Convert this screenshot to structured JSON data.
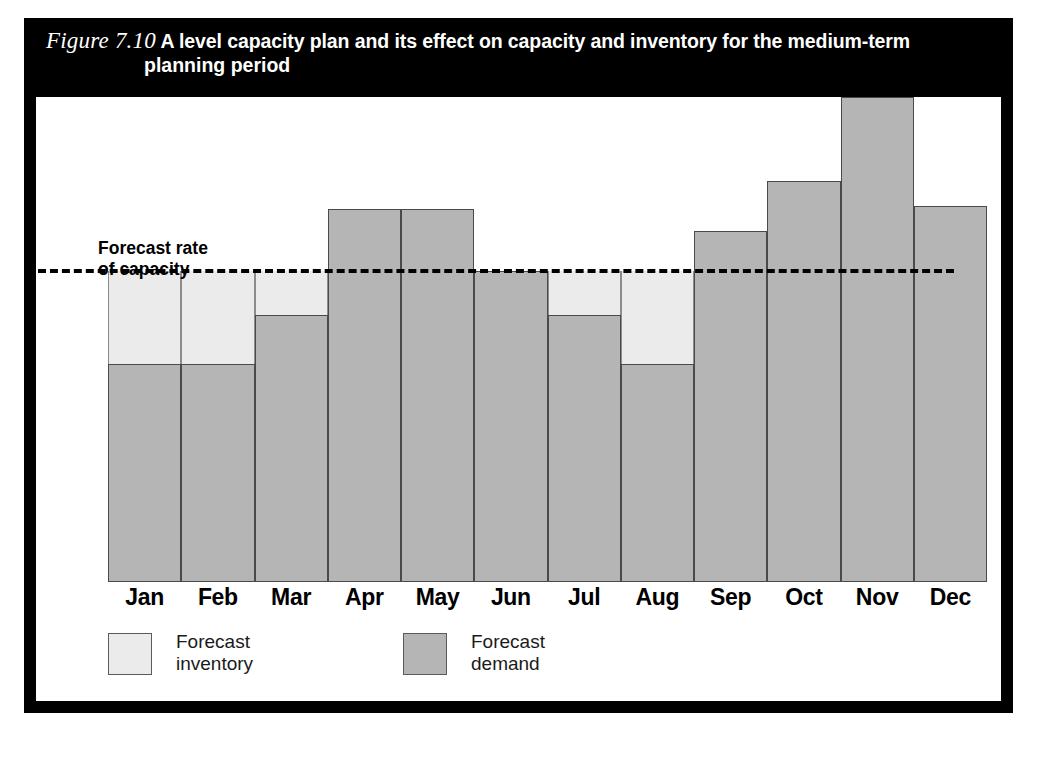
{
  "figure": {
    "number": "Figure 7.10",
    "title_line1": "A level capacity plan and its effect on capacity and inventory for the medium-term",
    "title_line2": "planning period"
  },
  "annotation": {
    "capacity_label_line1": "Forecast rate",
    "capacity_label_line2": "of capacity"
  },
  "legend": {
    "items": [
      {
        "label_line1": "Forecast",
        "label_line2": "inventory",
        "swatch": "light",
        "color": "#ebebeb"
      },
      {
        "label_line1": "Forecast",
        "label_line2": "demand",
        "swatch": "dark",
        "color": "#b5b5b5"
      }
    ]
  },
  "colors": {
    "frame": "#000000",
    "panel": "#ffffff",
    "inventory_fill": "#ebebeb",
    "demand_fill": "#b5b5b5",
    "demand_stroke": "#4a4a4a",
    "capacity_line": "#000000"
  },
  "chart_data": {
    "type": "bar",
    "title": "A level capacity plan and its effect on capacity and inventory for the medium-term planning period",
    "xlabel": "",
    "ylabel": "",
    "categories": [
      "Jan",
      "Feb",
      "Mar",
      "Apr",
      "May",
      "Jun",
      "Jul",
      "Aug",
      "Sep",
      "Oct",
      "Nov",
      "Dec"
    ],
    "ylim": [
      0,
      156
    ],
    "grid": false,
    "legend_position": "bottom-left",
    "annotations": [
      {
        "text": "Forecast rate of capacity",
        "type": "reference-line-label",
        "value": 100
      }
    ],
    "reference_line": {
      "label": "Forecast rate of capacity",
      "value": 100,
      "style": "dashed"
    },
    "series": [
      {
        "name": "Forecast demand",
        "color": "#b5b5b5",
        "values": [
          70,
          70,
          86,
          120,
          120,
          100,
          86,
          70,
          113,
          129,
          156,
          121
        ]
      },
      {
        "name": "Forecast inventory",
        "color": "#ebebeb",
        "note": "Cumulative shortfall region between forecast demand and the level capacity line, shown only where demand is below capacity",
        "values": [
          30,
          30,
          14,
          0,
          0,
          0,
          14,
          30,
          0,
          0,
          0,
          0
        ]
      }
    ]
  }
}
